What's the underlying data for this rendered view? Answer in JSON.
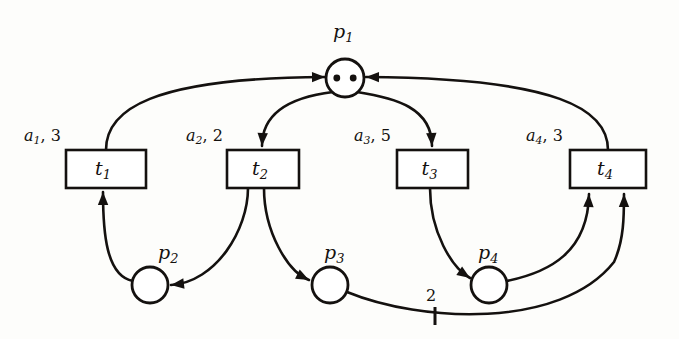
{
  "diagram": {
    "kind": "petri-net",
    "title": "",
    "background_color": "#fdfdfb",
    "ink_color": "#14110f"
  },
  "places": [
    {
      "id": "p1",
      "base": "p",
      "sub": "1",
      "label": "p1",
      "tokens": 2,
      "cx": 345,
      "cy": 78,
      "r": 19,
      "label_x": 333,
      "label_y": 22
    },
    {
      "id": "p2",
      "base": "p",
      "sub": "2",
      "label": "p2",
      "tokens": 0,
      "cx": 150,
      "cy": 285,
      "r": 18,
      "label_x": 158,
      "label_y": 243
    },
    {
      "id": "p3",
      "base": "p",
      "sub": "3",
      "label": "p3",
      "tokens": 0,
      "cx": 330,
      "cy": 285,
      "r": 18,
      "label_x": 324,
      "label_y": 243
    },
    {
      "id": "p4",
      "base": "p",
      "sub": "4",
      "label": "p4",
      "tokens": 0,
      "cx": 489,
      "cy": 285,
      "r": 18,
      "label_x": 478,
      "label_y": 243
    }
  ],
  "transitions": [
    {
      "id": "t1",
      "base": "t",
      "sub": "1",
      "label": "t1",
      "x": 66,
      "y": 150,
      "w": 80,
      "h": 38,
      "arc_label": "a1, 3",
      "arc_label_base": "a",
      "arc_label_sub": "1",
      "arc_label_rest": ", 3",
      "arc_label_x": 24,
      "arc_label_y": 128
    },
    {
      "id": "t2",
      "base": "t",
      "sub": "2",
      "label": "t2",
      "x": 227,
      "y": 150,
      "w": 72,
      "h": 38,
      "arc_label": "a2, 2",
      "arc_label_base": "a",
      "arc_label_sub": "2",
      "arc_label_rest": ", 2",
      "arc_label_x": 186,
      "arc_label_y": 128
    },
    {
      "id": "t3",
      "base": "t",
      "sub": "3",
      "label": "t3",
      "x": 397,
      "y": 150,
      "w": 71,
      "h": 38,
      "arc_label": "a3, 5",
      "arc_label_base": "a",
      "arc_label_sub": "3",
      "arc_label_rest": ", 5",
      "arc_label_x": 354,
      "arc_label_y": 128
    },
    {
      "id": "t4",
      "base": "t",
      "sub": "4",
      "label": "t4",
      "x": 570,
      "y": 150,
      "w": 76,
      "h": 38,
      "arc_label": "a4, 3",
      "arc_label_base": "a",
      "arc_label_sub": "4",
      "arc_label_rest": ", 3",
      "arc_label_x": 526,
      "arc_label_y": 128
    }
  ],
  "arcs": [
    {
      "id": "arc-t1-p1",
      "from": "t1",
      "to": "p1",
      "weight": "",
      "path": "M 106 150 C 106 110 150 78 325 77"
    },
    {
      "id": "arc-p1-t2",
      "from": "p1",
      "to": "t2",
      "weight": "",
      "path": "M 333 92 C 300 96 262 108 262 146"
    },
    {
      "id": "arc-p1-t3",
      "from": "p1",
      "to": "t3",
      "weight": "",
      "path": "M 357 92 C 396 98 432 108 432 146"
    },
    {
      "id": "arc-t4-p1",
      "from": "t4",
      "to": "p1",
      "weight": "",
      "path": "M 608 150 C 608 110 560 78 366 77"
    },
    {
      "id": "arc-p2-t1",
      "from": "p2",
      "to": "t1",
      "weight": "",
      "path": "M 133 281 C 106 276 103 232 103 192"
    },
    {
      "id": "arc-t2-p2",
      "from": "t2",
      "to": "p2",
      "weight": "",
      "path": "M 248 188 C 248 230 216 282 171 285"
    },
    {
      "id": "arc-t2-p3",
      "from": "t2",
      "to": "p3",
      "weight": "",
      "path": "M 264 188 C 264 232 288 272 309 280"
    },
    {
      "id": "arc-t3-p4",
      "from": "t3",
      "to": "p4",
      "weight": "",
      "path": "M 430 188 C 430 232 452 268 470 278"
    },
    {
      "id": "arc-p4-t4",
      "from": "p4",
      "to": "t4",
      "weight": "",
      "path": "M 507 281 C 550 272 588 252 589 194"
    },
    {
      "id": "arc-p3-t4",
      "from": "p3",
      "to": "t4",
      "weight": "2",
      "weight_x": 426,
      "weight_y": 288,
      "tick_x": 435,
      "tick_y1": 307,
      "tick_y2": 325,
      "path": "M 347 292 C 420 322 560 330 614 262 C 624 240 624 216 624 194"
    }
  ],
  "annotations": {
    "arc_weight_label": "2",
    "token_count_p1": 2
  }
}
